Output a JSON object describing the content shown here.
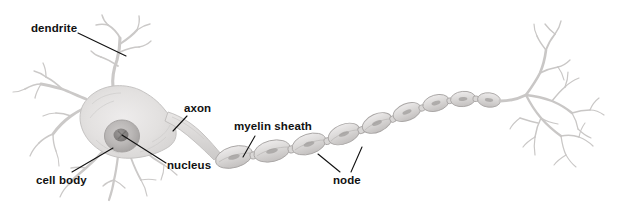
{
  "figure": {
    "width": 632,
    "height": 206,
    "background_color": "#ffffff",
    "style": "pencil-shaded grayscale biological illustration"
  },
  "labels": {
    "dendrite": "dendrite",
    "axon": "axon",
    "myelin_sheath": "myelin sheath",
    "nucleus": "nucleus",
    "cell_body": "cell body",
    "node": "node"
  },
  "colors": {
    "label_text": "#111111",
    "leader_line": "#111111",
    "soma_fill": "#e2e0df",
    "soma_edge": "#bdbbba",
    "nucleus_fill": "#c2bfbe",
    "nucleolus_fill": "#8e8b8a",
    "dendrite_stroke": "#cfcdcc",
    "myelin_fill": "#dedcdb",
    "myelin_edge": "#a9a6a5",
    "axon_fill": "#dddbda"
  },
  "parts": [
    {
      "name": "dendrite",
      "label": "dendrite",
      "description": "Branching tapered processes extending from the cell body, upper-left and lower-left"
    },
    {
      "name": "cell-body",
      "label": "cell body",
      "description": "Large shaded irregular soma at the left of the figure"
    },
    {
      "name": "nucleus",
      "label": "nucleus",
      "description": "Dark round organelle inside the cell body with a darker nucleolus"
    },
    {
      "name": "axon",
      "label": "axon",
      "description": "Long process leaving the cell body to the right"
    },
    {
      "name": "myelin-sheath",
      "label": "myelin sheath",
      "description": "Chain of lens-shaped segments wrapping the axon"
    },
    {
      "name": "node",
      "label": "node",
      "description": "Constricted gaps between adjacent myelin segments (nodes of Ranvier)"
    },
    {
      "name": "axon-terminals",
      "label": "",
      "description": "Fine branching terminal arbor at the right end of the axon"
    }
  ],
  "leader_lines": [
    {
      "name": "dendrite-leader",
      "from": [
        78,
        33
      ],
      "to": [
        126,
        56
      ]
    },
    {
      "name": "axon-leader",
      "from": [
        186,
        116
      ],
      "to": [
        173,
        131
      ]
    },
    {
      "name": "myelin-sheath-leader",
      "from": [
        254,
        136
      ],
      "to": [
        243,
        157
      ]
    },
    {
      "name": "nucleus-leader",
      "from": [
        166,
        163
      ],
      "to": [
        122,
        135
      ]
    },
    {
      "name": "cell-body-leader",
      "from": [
        72,
        172
      ],
      "to": [
        113,
        148
      ]
    },
    {
      "name": "node-leader-left",
      "from": [
        340,
        173
      ],
      "to": [
        318,
        155
      ]
    },
    {
      "name": "node-leader-right",
      "from": [
        351,
        173
      ],
      "to": [
        362,
        148
      ]
    }
  ]
}
